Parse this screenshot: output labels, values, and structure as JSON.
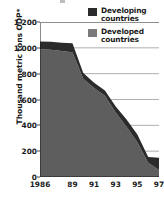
{
  "chart_data": {
    "type": "area",
    "stacked": true,
    "title": "",
    "subtitle": "",
    "xlabel": "",
    "ylabel": "Thousand metric tons ODP*",
    "footnote": "*",
    "x": [
      1986,
      1987,
      1988,
      1989,
      1990,
      1991,
      1992,
      1993,
      1994,
      1995,
      1996,
      1997
    ],
    "tick_labels": [
      "1986",
      "89",
      "91",
      "93",
      "95",
      "97"
    ],
    "tick_values": [
      1986,
      1989,
      1991,
      1993,
      1995,
      1997
    ],
    "ylim": [
      0,
      1200
    ],
    "yticks": [
      0,
      200,
      400,
      600,
      800,
      1000,
      1200
    ],
    "ytick_labels": [
      "0",
      "200",
      "400",
      "600",
      "800",
      "1 000",
      "1 200"
    ],
    "grid": true,
    "grid_axis": "y",
    "legend_position": "top-right",
    "series": [
      {
        "name": "Developed countries",
        "color": "#5e5e5e",
        "values": [
          990,
          985,
          975,
          965,
          760,
          690,
          630,
          500,
          390,
          270,
          110,
          55
        ]
      },
      {
        "name": "Developing countries",
        "color": "#2b2b2b",
        "values": [
          60,
          62,
          65,
          70,
          45,
          40,
          40,
          45,
          55,
          60,
          45,
          95
        ]
      }
    ],
    "totals": [
      1050,
      1047,
      1040,
      1035,
      805,
      730,
      670,
      545,
      445,
      330,
      155,
      150
    ]
  },
  "legend": {
    "items": [
      {
        "label_line1": "Developing",
        "label_line2": "countries",
        "swatch": "developing"
      },
      {
        "label_line1": "Developed",
        "label_line2": "countries",
        "swatch": "developed"
      }
    ]
  },
  "axes": {
    "y_title": "Thousand metric tons ODP*"
  }
}
